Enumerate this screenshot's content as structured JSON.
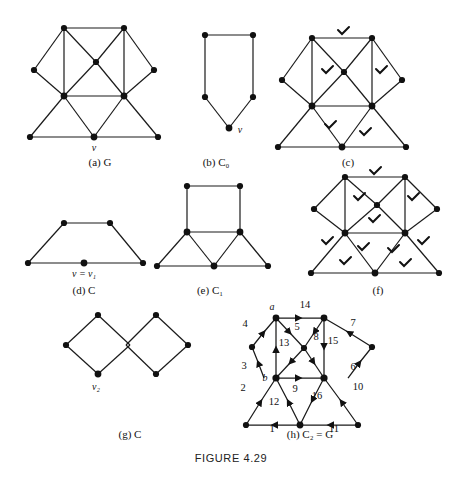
{
  "figure": {
    "title": "FIGURE 4.29",
    "domain": "textbook-figure-graph-theory"
  },
  "panels": [
    {
      "id": "a",
      "caption_label": "(a)",
      "caption_symbol": "G",
      "caption_sub": "",
      "vertex_labels": [
        {
          "text": "v",
          "x": 124,
          "y": 141
        }
      ]
    },
    {
      "id": "b",
      "caption_label": "(b)",
      "caption_symbol": "C",
      "caption_sub": "0",
      "vertex_labels": [
        {
          "text": "v",
          "x": 222,
          "y": 128
        }
      ]
    },
    {
      "id": "c",
      "caption_label": "(c)",
      "caption_symbol": "",
      "caption_sub": "",
      "vertex_labels": []
    },
    {
      "id": "d",
      "caption_label": "(d)",
      "caption_symbol": "C",
      "caption_sub": "",
      "vertex_labels": [
        {
          "text": "v = v₁",
          "x": 84,
          "y": 276
        }
      ]
    },
    {
      "id": "e",
      "caption_label": "(e)",
      "caption_symbol": "C",
      "caption_sub": "1",
      "vertex_labels": []
    },
    {
      "id": "f",
      "caption_label": "(f)",
      "caption_symbol": "",
      "caption_sub": "",
      "vertex_labels": []
    },
    {
      "id": "g",
      "caption_label": "(g)",
      "caption_symbol": "C",
      "caption_sub": "",
      "vertex_labels": [
        {
          "text": "v₂",
          "x": 96,
          "y": 409
        }
      ]
    },
    {
      "id": "h",
      "caption_label": "(h)",
      "caption_symbol": "C₂  =  G",
      "caption_sub": "",
      "vertex_labels": [
        {
          "text": "a",
          "x": 273,
          "y": 312
        },
        {
          "text": "b",
          "x": 264,
          "y": 379
        }
      ]
    }
  ],
  "captions": {
    "a": "(a)  G",
    "b": "(b)  C₀",
    "c": "(c)",
    "d": "(d)  C",
    "e": "(e)  C₁",
    "f": "(f)",
    "g": "(g)  C",
    "h": "(h)  C₂  =  G"
  },
  "caption_positions": {
    "a": {
      "x": 100,
      "y": 160
    },
    "b": {
      "x": 216,
      "y": 160
    },
    "c": {
      "x": 348,
      "y": 160
    },
    "d": {
      "x": 84,
      "y": 294
    },
    "e": {
      "x": 210,
      "y": 294
    },
    "f": {
      "x": 378,
      "y": 294
    },
    "g": {
      "x": 130,
      "y": 438
    },
    "h": {
      "x": 310,
      "y": 438
    }
  },
  "edge_numbers": [
    {
      "n": "1",
      "x": 272,
      "y": 432
    },
    {
      "n": "2",
      "x": 243,
      "y": 391
    },
    {
      "n": "3",
      "x": 244,
      "y": 369
    },
    {
      "n": "4",
      "x": 245,
      "y": 327
    },
    {
      "n": "5",
      "x": 297,
      "y": 330
    },
    {
      "n": "6",
      "x": 353,
      "y": 370
    },
    {
      "n": "7",
      "x": 353,
      "y": 326
    },
    {
      "n": "8",
      "x": 316,
      "y": 340
    },
    {
      "n": "9",
      "x": 295,
      "y": 392
    },
    {
      "n": "10",
      "x": 358,
      "y": 390
    },
    {
      "n": "11",
      "x": 334,
      "y": 432
    },
    {
      "n": "12",
      "x": 274,
      "y": 405
    },
    {
      "n": "13",
      "x": 281,
      "y": 346
    },
    {
      "n": "14",
      "x": 305,
      "y": 308
    },
    {
      "n": "15",
      "x": 332,
      "y": 344
    },
    {
      "n": "16",
      "x": 317,
      "y": 399
    }
  ],
  "graph_structure": {
    "panel_a_vertices": 11,
    "panel_b_vertices": 5,
    "panel_d_vertices": 5,
    "panel_g_vertices": 7,
    "panel_h_directed_edges": 16
  },
  "colors": {
    "ink": "#111111",
    "paper": "#ffffff",
    "edge": "#1a1a1a",
    "caption": "#111111"
  }
}
